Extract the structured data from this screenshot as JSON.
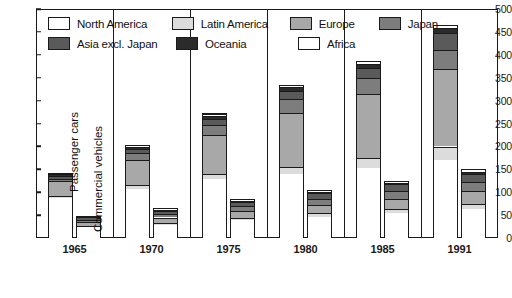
{
  "chart_data": {
    "type": "bar",
    "subtype": "stacked-grouped-bar",
    "title": "",
    "xlabel": "",
    "ylabel": "",
    "ylim": [
      0,
      500
    ],
    "yticks": [
      0,
      50,
      100,
      150,
      200,
      250,
      300,
      350,
      400,
      450,
      500
    ],
    "ytick_labels": [
      "0",
      "50",
      "100",
      "150",
      "200",
      "250",
      "300",
      "350",
      "400",
      "450",
      "500"
    ],
    "grid": false,
    "legend_position": "top-inside",
    "categories": [
      "1965",
      "1970",
      "1975",
      "1980",
      "1985",
      "1991"
    ],
    "group_labels": [
      "Passenger cars",
      "Commercial vehicles"
    ],
    "stack_order": [
      "North America",
      "Latin America",
      "Europe",
      "Japan",
      "Asia excl. Japan",
      "Oceania",
      "Africa"
    ],
    "colors": {
      "North America": "#ffffff",
      "Latin America": "#dcdcdc",
      "Europe": "#a8a8a8",
      "Japan": "#7d7d7d",
      "Asia excl. Japan": "#5a5a5a",
      "Oceania": "#2b2b2b",
      "Africa": "#ffffff"
    },
    "groups": [
      {
        "name": "Passenger cars",
        "series": [
          {
            "name": "North America",
            "values": [
              88,
              108,
              128,
              139,
              152,
              170
            ]
          },
          {
            "name": "Latin America",
            "values": [
              5,
              8,
              13,
              17,
              23,
              30
            ]
          },
          {
            "name": "Europe",
            "values": [
              32,
              55,
              85,
              118,
              140,
              170
            ]
          },
          {
            "name": "Japan",
            "values": [
              4,
              14,
              22,
              29,
              34,
              41
            ]
          },
          {
            "name": "Asia excl. Japan",
            "values": [
              6,
              9,
              12,
              18,
              22,
              37
            ]
          },
          {
            "name": "Oceania",
            "values": [
              5,
              6,
              7,
              8,
              9,
              10
            ]
          },
          {
            "name": "Africa",
            "values": [
              3,
              4,
              5,
              6,
              7,
              8
            ]
          }
        ],
        "totals": [
          143,
          204,
          272,
          335,
          387,
          466
        ]
      },
      {
        "name": "Commercial vehicles",
        "series": [
          {
            "name": "North America",
            "values": [
              24,
              29,
              39,
              47,
              55,
              63
            ]
          },
          {
            "name": "Latin America",
            "values": [
              3,
              4,
              5,
              7,
              9,
              12
            ]
          },
          {
            "name": "Europe",
            "values": [
              9,
              12,
              15,
              18,
              22,
              27
            ]
          },
          {
            "name": "Japan",
            "values": [
              4,
              8,
              11,
              14,
              17,
              20
            ]
          },
          {
            "name": "Asia excl. Japan",
            "values": [
              5,
              7,
              9,
              12,
              15,
              19
            ]
          },
          {
            "name": "Oceania",
            "values": [
              2,
              2,
              3,
              3,
              3,
              4
            ]
          },
          {
            "name": "Africa",
            "values": [
              2,
              3,
              3,
              4,
              4,
              5
            ]
          }
        ],
        "totals": [
          49,
          65,
          85,
          105,
          125,
          150
        ]
      }
    ],
    "legend": [
      {
        "label": "North America",
        "color": "#ffffff"
      },
      {
        "label": "Latin America",
        "color": "#dcdcdc"
      },
      {
        "label": "Europe",
        "color": "#a8a8a8"
      },
      {
        "label": "Japan",
        "color": "#7d7d7d"
      },
      {
        "label": "Asia excl. Japan",
        "color": "#5a5a5a"
      },
      {
        "label": "Oceania",
        "color": "#2b2b2b"
      },
      {
        "label": "Africa",
        "color": "#ffffff"
      }
    ]
  }
}
